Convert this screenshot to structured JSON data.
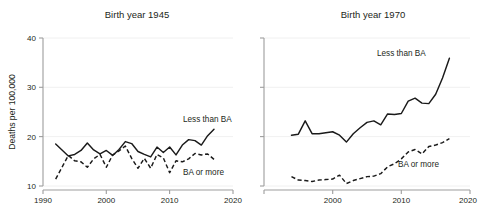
{
  "figure": {
    "ylabel": "Deaths per 100,000",
    "y_ticks": [
      "10",
      "20",
      "30",
      "40"
    ],
    "x_ticks": [
      "1990",
      "2000",
      "2010",
      "2020"
    ],
    "series_labels": {
      "less_than_ba": "Less than BA",
      "ba_or_more": "BA or more"
    },
    "colors": {
      "line": "#1a1a1a",
      "grid": "#ececec",
      "spine": "#9d9d9d",
      "text": "#231f20",
      "background": "#ffffff"
    }
  },
  "chart_data": [
    {
      "type": "line",
      "title": "Birth year 1945",
      "xlabel": "",
      "ylabel": "Deaths per 100,000",
      "xlim": [
        1990,
        2020
      ],
      "ylim": [
        10,
        40
      ],
      "yticks": [
        10,
        20,
        30,
        40
      ],
      "xticks": [
        1990,
        2000,
        2010,
        2020
      ],
      "grid": true,
      "legend": "inline-annotation",
      "x": [
        1992,
        1993,
        1994,
        1995,
        1996,
        1997,
        1998,
        1999,
        2000,
        2001,
        2002,
        2003,
        2004,
        2005,
        2006,
        2007,
        2008,
        2009,
        2010,
        2011,
        2012,
        2013,
        2014,
        2015,
        2016,
        2017
      ],
      "series": [
        {
          "name": "Less than BA",
          "style": "solid",
          "values": [
            18.5,
            17.3,
            16.1,
            16.4,
            17.2,
            18.7,
            17.3,
            16.5,
            17.2,
            16.2,
            17.4,
            19.0,
            18.6,
            17.0,
            16.4,
            15.9,
            17.9,
            16.8,
            17.9,
            16.3,
            18.3,
            19.4,
            19.2,
            18.3,
            20.2,
            21.5
          ]
        },
        {
          "name": "BA or more",
          "style": "dashed",
          "values": [
            11.4,
            13.8,
            16.2,
            15.1,
            14.9,
            13.8,
            15.5,
            16.4,
            13.8,
            16.3,
            17.1,
            18.1,
            15.6,
            13.6,
            15.6,
            13.6,
            16.4,
            15.7,
            12.7,
            15.1,
            14.9,
            15.5,
            16.6,
            16.3,
            16.5,
            15.4
          ]
        }
      ]
    },
    {
      "type": "line",
      "title": "Birth year 1970",
      "xlabel": "",
      "ylabel": "Deaths per 100,000",
      "xlim": [
        1990,
        2020
      ],
      "ylim": [
        10,
        40
      ],
      "yticks": [
        10,
        20,
        30,
        40
      ],
      "xticks": [
        1990,
        2000,
        2010,
        2020
      ],
      "grid": true,
      "legend": "inline-annotation",
      "x": [
        1994,
        1995,
        1996,
        1997,
        1998,
        1999,
        2000,
        2001,
        2002,
        2003,
        2004,
        2005,
        2006,
        2007,
        2008,
        2009,
        2010,
        2011,
        2012,
        2013,
        2014,
        2015,
        2016,
        2017
      ],
      "series": [
        {
          "name": "Less than BA",
          "style": "solid",
          "values": [
            20.3,
            20.5,
            23.2,
            20.6,
            20.6,
            20.8,
            21.0,
            20.3,
            18.9,
            20.6,
            21.8,
            22.9,
            23.2,
            22.4,
            24.6,
            24.5,
            24.7,
            27.2,
            27.8,
            26.8,
            26.7,
            28.6,
            31.9,
            35.9
          ]
        },
        {
          "name": "BA or more",
          "style": "dashed",
          "values": [
            11.9,
            11.2,
            11.1,
            10.9,
            11.2,
            11.3,
            11.4,
            12.2,
            10.5,
            11.1,
            11.5,
            11.9,
            12.0,
            12.5,
            13.9,
            14.5,
            15.5,
            16.9,
            17.4,
            16.5,
            18.0,
            18.3,
            18.8,
            19.6
          ]
        }
      ]
    }
  ]
}
